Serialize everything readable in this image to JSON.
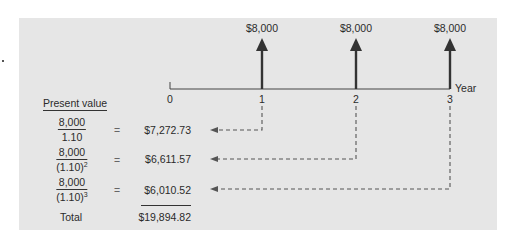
{
  "figure": {
    "timeline": {
      "axis_label": "Year",
      "ticks": [
        "0",
        "1",
        "2",
        "3"
      ],
      "cash_flows": [
        {
          "year": "1",
          "amount": "$8,000"
        },
        {
          "year": "2",
          "amount": "$8,000"
        },
        {
          "year": "3",
          "amount": "$8,000"
        }
      ]
    },
    "present_value_table": {
      "heading": "Present value",
      "rows": [
        {
          "numerator": "8,000",
          "denominator": "1.10",
          "exponent": "",
          "equals": "=",
          "value": "$7,272.73"
        },
        {
          "numerator": "8,000",
          "denominator": "(1.10)",
          "exponent": "2",
          "equals": "=",
          "value": "$6,611.57"
        },
        {
          "numerator": "8,000",
          "denominator": "(1.10)",
          "exponent": "3",
          "equals": "=",
          "value": "$6,010.52"
        }
      ],
      "total_label": "Total",
      "total_value": "$19,894.82"
    },
    "colors": {
      "panel_background": "#e6e6e6",
      "arrow": "#333333",
      "dashed_line": "#555555",
      "text": "#2b2b2b"
    }
  }
}
